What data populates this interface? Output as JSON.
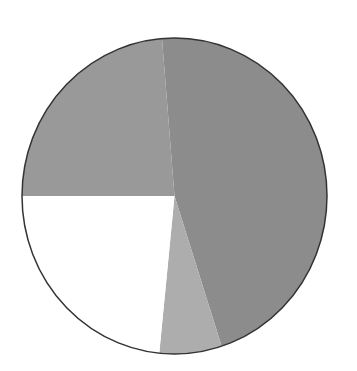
{
  "chart_data": {
    "type": "pie",
    "title": "",
    "labels": [
      "Slice A",
      "Slice B",
      "Slice C",
      "Slice D"
    ],
    "values": [
      46.3,
      6.6,
      23.4,
      23.7
    ],
    "colors": [
      "#8c8c8c",
      "#adadad",
      "#ffffff",
      "#999999"
    ],
    "start_angle_deg": -4.7,
    "direction": "clockwise",
    "legend": "none",
    "outline_color": "#333333"
  }
}
